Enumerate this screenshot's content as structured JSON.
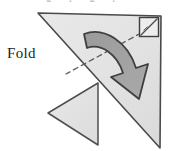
{
  "figure": {
    "title": "Fold",
    "clipped_top_text": "g l g r",
    "labels": {
      "fold": "Fold"
    },
    "colors": {
      "paper_fill": "#e2e2e2",
      "paper_fill_light": "#e7e7e7",
      "paper_stroke": "#4a4a4a",
      "flap_fill": "#e4e4e4",
      "flap_stroke": "#4f4f4f",
      "arrow_fill": "#9d9d9d",
      "arrow_stroke": "#3f3f3f",
      "fold_line": "#5a5a5a",
      "background": "#ffffff",
      "text": "#1d1d1d"
    },
    "canvas": {
      "width": 169,
      "height": 151
    },
    "shapes": {
      "main_triangle": {
        "name": "main-paper-triangle",
        "points": "38,13 161,16 160,148",
        "description": "large right triangle sheet of paper"
      },
      "folded_flap_triangle": {
        "name": "folded-flap-triangle",
        "points": "48,113 98,83 98,145",
        "description": "small triangle flap already folded out to the left"
      },
      "right_angle_marker": {
        "name": "right-angle-marker",
        "points": "140,18 158,18 158,36",
        "box": "140,18 158,18 158,36 140,36",
        "description": "square right-angle symbol with diagonal at the top-right corner"
      },
      "fold_dashed_line": {
        "name": "fold-dashed-line",
        "from": "141,33",
        "to": "66,74",
        "description": "dashed crease line showing where the paper folds"
      },
      "curved_arrow": {
        "name": "fold-direction-arrow",
        "direction": "clockwise",
        "from": "84,34",
        "to": "140,96",
        "description": "thick curved arrow indicating the folding motion"
      }
    }
  }
}
